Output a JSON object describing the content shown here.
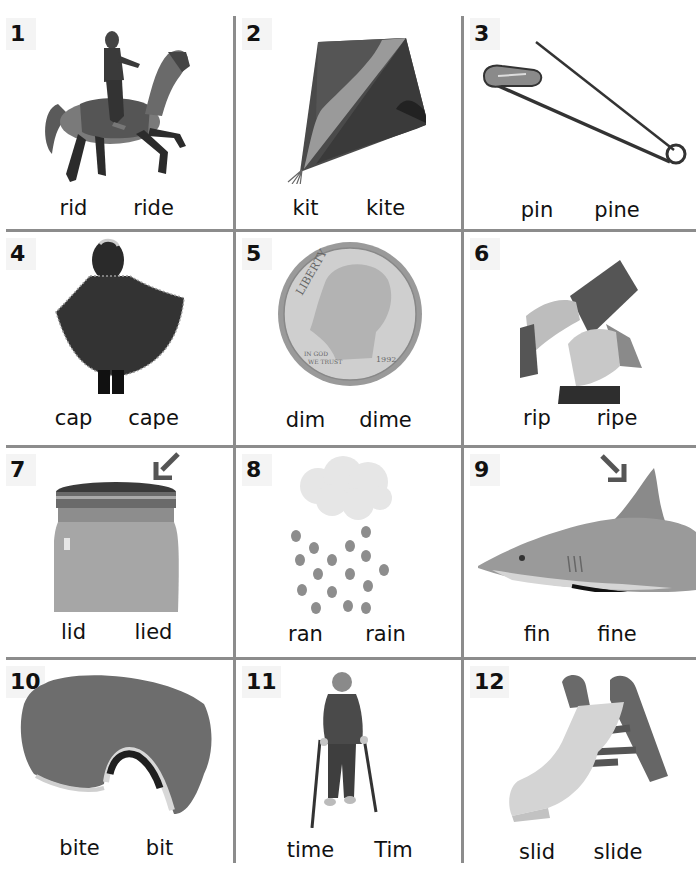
{
  "worksheet": {
    "title": "",
    "colors": {
      "grid_line": "#8c8c8c",
      "number_badge_bg": "#f4f4f4",
      "arrow": "#555555"
    },
    "items": [
      {
        "number": "1",
        "picture": "girl riding carousel horse",
        "words": [
          "rid",
          "ride"
        ]
      },
      {
        "number": "2",
        "picture": "kite",
        "words": [
          "kit",
          "kite"
        ]
      },
      {
        "number": "3",
        "picture": "safety pin",
        "words": [
          "pin",
          "pine"
        ]
      },
      {
        "number": "4",
        "picture": "child wearing cape",
        "words": [
          "cap",
          "cape"
        ]
      },
      {
        "number": "5",
        "picture": "dime coin",
        "words": [
          "dim",
          "dime"
        ],
        "coin_text": {
          "legend": "LIBERTY",
          "motto": "IN GOD WE TRUST",
          "year": "1992"
        }
      },
      {
        "number": "6",
        "picture": "hands ripping paper",
        "words": [
          "rip",
          "ripe"
        ]
      },
      {
        "number": "7",
        "picture": "jar with lid, arrow pointing to lid",
        "words": [
          "lid",
          "lied"
        ]
      },
      {
        "number": "8",
        "picture": "rain cloud with raindrops",
        "words": [
          "ran",
          "rain"
        ]
      },
      {
        "number": "9",
        "picture": "shark, arrow pointing to fin",
        "words": [
          "fin",
          "fine"
        ]
      },
      {
        "number": "10",
        "picture": "sandwich with bite taken",
        "words": [
          "bite",
          "bit"
        ]
      },
      {
        "number": "11",
        "picture": "boy walking with crutches",
        "words": [
          "time",
          "Tim"
        ]
      },
      {
        "number": "12",
        "picture": "children's slide",
        "words": [
          "slid",
          "slide"
        ]
      }
    ]
  }
}
